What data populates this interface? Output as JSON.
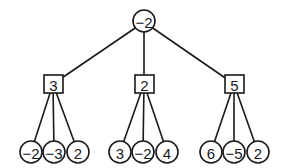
{
  "diagram": {
    "type": "game-tree",
    "root": {
      "value": "−2",
      "shape": "circle"
    },
    "children": [
      {
        "value": "3",
        "shape": "square",
        "leaves": [
          "−2",
          "−3",
          "2"
        ]
      },
      {
        "value": "2",
        "shape": "square",
        "leaves": [
          "3",
          "−2",
          "4"
        ]
      },
      {
        "value": "5",
        "shape": "square",
        "leaves": [
          "6",
          "−5",
          "2"
        ]
      }
    ]
  }
}
